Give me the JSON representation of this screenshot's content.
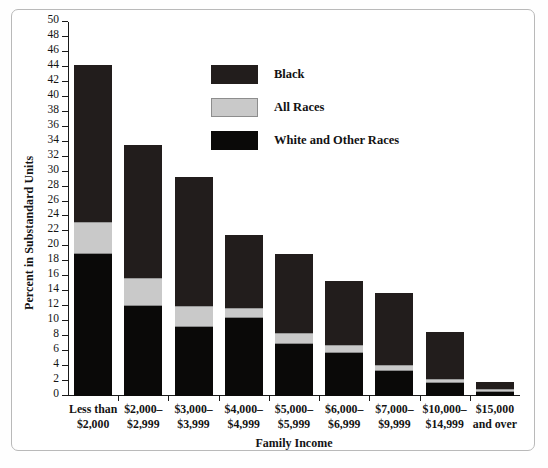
{
  "chart_data": {
    "type": "bar",
    "subtype": "overlaid-stacked-bands",
    "title": "",
    "xlabel": "Family Income",
    "ylabel": "Percent in Substandard Units",
    "ylim": [
      0,
      50
    ],
    "ytick_step": 2,
    "yticks": [
      0,
      2,
      4,
      6,
      8,
      10,
      12,
      14,
      16,
      18,
      20,
      22,
      24,
      26,
      28,
      30,
      32,
      34,
      36,
      38,
      40,
      42,
      44,
      46,
      48,
      50
    ],
    "grid": false,
    "legend_position": "upper-center",
    "categories": [
      "Less than\n$2,000",
      "$2,000–\n$2,999",
      "$3,000–\n$3,999",
      "$4,000–\n$4,999",
      "$5,000–\n$5,999",
      "$6,000–\n$6,999",
      "$7,000–\n$9,999",
      "$10,000–\n$14,999",
      "$15,000\nand over"
    ],
    "series": [
      {
        "name": "Black",
        "color": "#221d1c",
        "values": [
          44.3,
          33.6,
          29.3,
          21.5,
          19.0,
          15.4,
          13.8,
          8.6,
          1.9
        ]
      },
      {
        "name": "All Races",
        "color": "#c9c9c9",
        "values": [
          23.3,
          15.8,
          12.0,
          11.8,
          8.4,
          6.8,
          4.2,
          2.3,
          0.9
        ]
      },
      {
        "name": "White and Other Races",
        "color": "#0a0908",
        "values": [
          19.0,
          12.0,
          9.2,
          10.4,
          7.0,
          5.8,
          3.4,
          1.8,
          0.6
        ]
      }
    ]
  },
  "axis": {
    "ylabel": "Percent in Substandard Units",
    "xlabel": "Family Income"
  },
  "legend": {
    "items": [
      {
        "label": "Black",
        "swatch": "black-swatch"
      },
      {
        "label": "All Races",
        "swatch": "gray-swatch"
      },
      {
        "label": "White and Other Races",
        "swatch": "white-other-swatch"
      }
    ]
  },
  "colors": {
    "black_series": "#221d1c",
    "all_races_series": "#c9c9c9",
    "white_other_series": "#0a0908",
    "axis": "#1a1a1a",
    "frame": "#b9b9b9"
  }
}
